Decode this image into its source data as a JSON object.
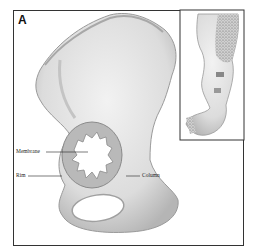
{
  "figure": {
    "panel_label": "A",
    "labels": {
      "membrane": "Membrane",
      "rim": "Rim",
      "column": "Column"
    },
    "colors": {
      "bone_fill": "#e6e6e6",
      "bone_shade": "#b8b8b8",
      "frame": "#333333",
      "stipple": "#7a7a7a"
    }
  }
}
